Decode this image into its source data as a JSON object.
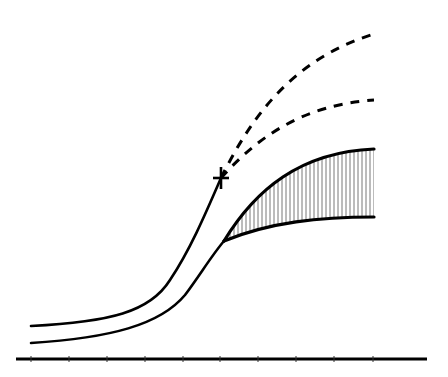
{
  "diagram": {
    "type": "schematic-growth-curves",
    "colors": {
      "stroke": "#000000",
      "hatch": "#555555",
      "background": "#ffffff"
    },
    "axis": {
      "y": 359,
      "x_start": 16,
      "x_end": 427,
      "tick_positions": [
        31,
        69,
        107,
        145,
        183,
        220,
        258,
        296,
        334,
        373
      ],
      "labels": []
    },
    "marker": {
      "symbol": "cross",
      "x": 221,
      "y": 178
    },
    "curves": [
      {
        "name": "upper-solid-curve",
        "style": "solid",
        "path": "M31,326 C110,322 150,312 170,280 C190,250 205,215 221,178"
      },
      {
        "name": "lower-solid-curve",
        "style": "solid",
        "path": "M31,343 C110,338 160,325 185,295 C200,275 212,255 224,241"
      },
      {
        "name": "dashed-upper-projection",
        "style": "dashed",
        "path": "M221,178 C250,120 290,60 374,34"
      },
      {
        "name": "dashed-lower-projection",
        "style": "dashed",
        "path": "M221,178 C255,140 300,105 374,100"
      }
    ],
    "band": {
      "name": "hatched-band",
      "upper_edge": "M224,241 C255,190 300,152 374,149",
      "lower_edge": "M224,241 C270,222 320,217 374,217",
      "fill_path": "M224,241 C255,190 300,152 374,149 L374,217 C320,217 270,222 224,241 Z",
      "hatch_x_start": 226,
      "hatch_x_end": 374,
      "hatch_spacing": 4
    },
    "text_labels": []
  }
}
